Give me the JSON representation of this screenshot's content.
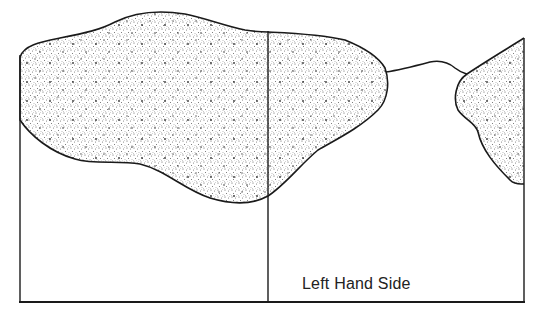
{
  "diagram": {
    "label": "Left Hand Side",
    "stroke_color": "#1a1a1a",
    "stipple_color": "#6b6b6b",
    "background": "#ffffff",
    "regions": [
      {
        "name": "left-stippled-blob",
        "fill": "stippled"
      },
      {
        "name": "right-stippled-blob",
        "fill": "stippled"
      }
    ]
  }
}
